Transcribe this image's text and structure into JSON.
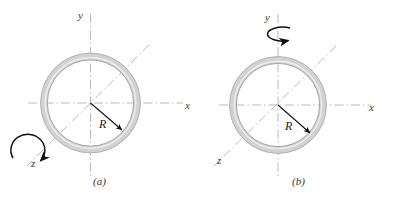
{
  "figure": {
    "type": "physics-diagram",
    "background_color": "#ffffff",
    "ring_fill_color": "#d2d2d2",
    "ring_outline_color": "#a8a8a8",
    "axis_color": "#b9b9b9",
    "arrow_color": "#111111",
    "panels": [
      {
        "id": "a",
        "caption": "(a)",
        "radius_label": "R",
        "axes": [
          {
            "name": "x-axis",
            "label": "x"
          },
          {
            "name": "y-axis",
            "label": "y"
          },
          {
            "name": "z-axis",
            "label": "z"
          }
        ],
        "rotation_axis": "z",
        "rotation_arrow_name": "rotation-arrow-z"
      },
      {
        "id": "b",
        "caption": "(b)",
        "radius_label": "R",
        "axes": [
          {
            "name": "x-axis",
            "label": "x"
          },
          {
            "name": "y-axis",
            "label": "y"
          },
          {
            "name": "z-axis",
            "label": "z"
          }
        ],
        "rotation_axis": "y",
        "rotation_arrow_name": "rotation-arrow-y"
      }
    ]
  }
}
